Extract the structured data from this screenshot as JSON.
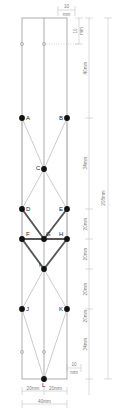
{
  "drawing": {
    "title": "Truss Panel Elevation",
    "units": "mm",
    "colors": {
      "node": "#111111",
      "member_active": "#555555",
      "member_idle": "#bcbcbc",
      "outline": "#8a8a8a",
      "dimension": "#9a9a9a",
      "dimension_text": "#7a7a7a",
      "background": "#ffffff"
    }
  },
  "nodes": [
    {
      "id": "A",
      "label": "A",
      "x": 22,
      "y": 118,
      "label_dx": 4,
      "label_dy": 2
    },
    {
      "id": "B",
      "label": "B",
      "x": 67,
      "y": 118,
      "label_dx": -8,
      "label_dy": 2
    },
    {
      "id": "C",
      "label": "C",
      "x": 44,
      "y": 169,
      "label_dx": -8,
      "label_dy": 1
    },
    {
      "id": "D",
      "label": "D",
      "x": 22,
      "y": 209,
      "label_dx": 4,
      "label_dy": 2
    },
    {
      "id": "E",
      "label": "E",
      "x": 67,
      "y": 209,
      "label_dx": -8,
      "label_dy": 2
    },
    {
      "id": "F",
      "label": "F",
      "x": 22,
      "y": 239,
      "label_dx": 4,
      "label_dy": -3
    },
    {
      "id": "G",
      "label": "G",
      "x": 44,
      "y": 239,
      "label_dx": 2,
      "label_dy": -3
    },
    {
      "id": "H",
      "label": "H",
      "x": 67,
      "y": 239,
      "label_dx": -8,
      "label_dy": -3
    },
    {
      "id": "I",
      "label": "I",
      "x": 44,
      "y": 269,
      "label_dx": -5,
      "label_dy": -2
    },
    {
      "id": "J",
      "label": "J",
      "x": 22,
      "y": 309,
      "label_dx": 4,
      "label_dy": 2
    },
    {
      "id": "K",
      "label": "K",
      "x": 67,
      "y": 309,
      "label_dx": -8,
      "label_dy": 2
    },
    {
      "id": "L",
      "label": "L",
      "x": 44,
      "y": 379,
      "label_dx": -2,
      "label_dy": 8
    }
  ],
  "members": [
    {
      "from": "A",
      "to": "C",
      "state": "idle"
    },
    {
      "from": "B",
      "to": "C",
      "state": "idle"
    },
    {
      "from": "A",
      "to": "D",
      "state": "idle"
    },
    {
      "from": "B",
      "to": "E",
      "state": "idle"
    },
    {
      "from": "C",
      "to": "D",
      "state": "idle"
    },
    {
      "from": "C",
      "to": "E",
      "state": "idle"
    },
    {
      "from": "D",
      "to": "G",
      "state": "active"
    },
    {
      "from": "E",
      "to": "G",
      "state": "active"
    },
    {
      "from": "D",
      "to": "F",
      "state": "idle"
    },
    {
      "from": "E",
      "to": "H",
      "state": "idle"
    },
    {
      "from": "F",
      "to": "G",
      "state": "active"
    },
    {
      "from": "G",
      "to": "H",
      "state": "active"
    },
    {
      "from": "F",
      "to": "I",
      "state": "active"
    },
    {
      "from": "H",
      "to": "I",
      "state": "active"
    },
    {
      "from": "I",
      "to": "J",
      "state": "idle"
    },
    {
      "from": "I",
      "to": "K",
      "state": "idle"
    },
    {
      "from": "J",
      "to": "L",
      "state": "idle"
    },
    {
      "from": "K",
      "to": "L",
      "state": "idle"
    }
  ],
  "holes": [
    {
      "id": "hole-top-left",
      "x": 22,
      "y": 44
    },
    {
      "id": "hole-top-right",
      "x": 44,
      "y": 44
    },
    {
      "id": "hole-bottom-left",
      "x": 22,
      "y": 352
    },
    {
      "id": "hole-bottom-right",
      "x": 44,
      "y": 352
    }
  ],
  "dimensions": {
    "top_width": {
      "label": "10",
      "sublabel": "mm",
      "value": 10
    },
    "top_height": {
      "label": "10",
      "sublabel": "mm",
      "value": 10
    },
    "bottom_offset": {
      "label": "10",
      "sublabel": "mm",
      "value": 10
    },
    "overall_height": {
      "label": "208mm",
      "value": 208
    },
    "vertical_chain": [
      {
        "label": "40mm",
        "value": 40
      },
      {
        "label": "34mm",
        "value": 34
      },
      {
        "label": "20mm",
        "value": 20
      },
      {
        "label": "20mm",
        "value": 20
      },
      {
        "label": "20mm",
        "value": 20
      },
      {
        "label": "20mm",
        "value": 20
      },
      {
        "label": "34mm",
        "value": 34
      }
    ],
    "bottom_chain": [
      {
        "label": "20mm",
        "value": 20
      },
      {
        "label": "20mm",
        "value": 20
      }
    ],
    "bottom_total": {
      "label": "40mm",
      "value": 40
    }
  }
}
